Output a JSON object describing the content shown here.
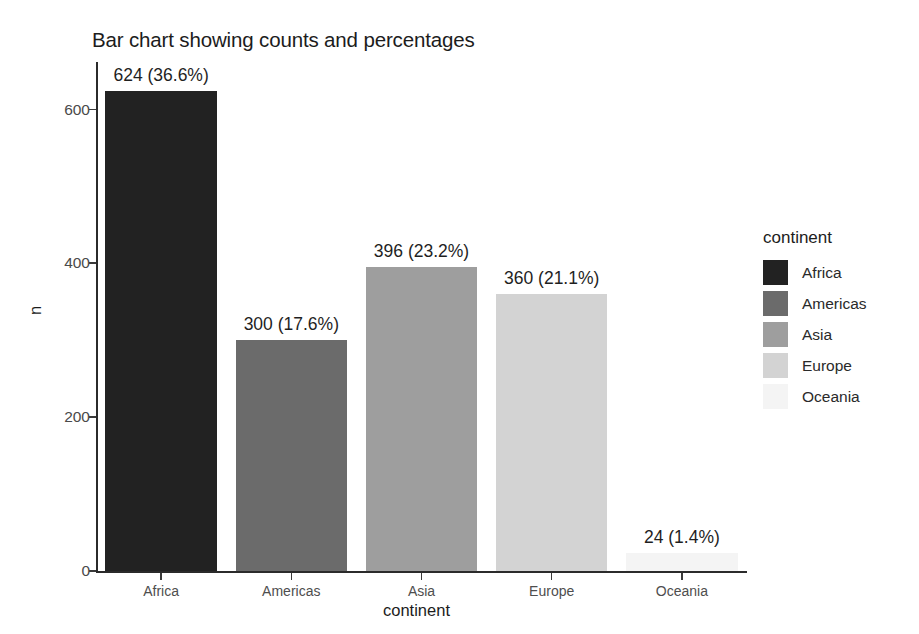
{
  "chart_data": {
    "type": "bar",
    "title": "Bar chart showing counts and percentages",
    "xlabel": "continent",
    "ylabel": "n",
    "categories": [
      "Africa",
      "Americas",
      "Asia",
      "Europe",
      "Oceania"
    ],
    "values": [
      624,
      300,
      396,
      360,
      24
    ],
    "percentages": [
      "36.6%",
      "17.6%",
      "23.2%",
      "21.1%",
      "1.4%"
    ],
    "data_labels": [
      "624 (36.6%)",
      "300 (17.6%)",
      "396 (23.2%)",
      "360 (21.1%)",
      "24 (1.4%)"
    ],
    "ylim": [
      0,
      662
    ],
    "yticks": [
      0,
      200,
      400,
      600
    ],
    "ytick_labels": [
      "0",
      "200",
      "400",
      "600"
    ],
    "grid": false,
    "legend_position": "right",
    "legend_title": "continent",
    "colors": [
      "#222222",
      "#6b6b6b",
      "#9e9e9e",
      "#d3d3d3",
      "#f4f4f4"
    ],
    "series": [
      {
        "name": "n",
        "values": [
          624,
          300,
          396,
          360,
          24
        ]
      }
    ]
  },
  "legend": {
    "title": "continent",
    "items": [
      {
        "label": "Africa",
        "color": "#222222"
      },
      {
        "label": "Americas",
        "color": "#6b6b6b"
      },
      {
        "label": "Asia",
        "color": "#9e9e9e"
      },
      {
        "label": "Europe",
        "color": "#d3d3d3"
      },
      {
        "label": "Oceania",
        "color": "#f4f4f4"
      }
    ]
  },
  "axes": {
    "y_title": "n",
    "x_title": "continent"
  }
}
